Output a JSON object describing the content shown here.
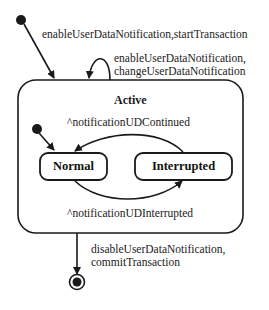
{
  "diagram": {
    "type": "uml-state-machine",
    "composite_state": {
      "name": "Active"
    },
    "states": [
      {
        "id": "normal",
        "name": "Normal"
      },
      {
        "id": "interrupted",
        "name": "Interrupted"
      }
    ],
    "transitions": {
      "initial_to_active": {
        "label": "enableUserDataNotification,startTransaction"
      },
      "active_self_loop": {
        "line1": "enableUserDataNotification,",
        "line2": "changeUserDataNotification"
      },
      "interrupted_to_normal": {
        "label": "^notificationUDContinued"
      },
      "normal_to_interrupted": {
        "label": "^notificationUDInterrupted"
      },
      "active_to_final": {
        "line1": "disableUserDataNotification,",
        "line2": "commitTransaction"
      }
    },
    "colors": {
      "line": "#1a1a1a",
      "background": "#ffffff"
    }
  }
}
